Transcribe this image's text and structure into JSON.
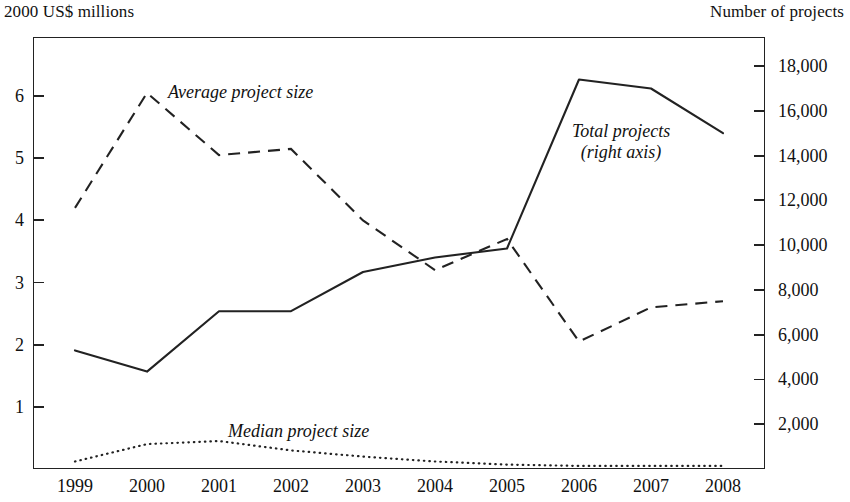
{
  "axis_titles": {
    "left": "2000 US$ millions",
    "right": "Number of projects"
  },
  "annotations": {
    "average": "Average project size",
    "total_line1": "Total projects",
    "total_line2": "(right axis)",
    "median": "Median project size"
  },
  "colors": {
    "ink": "#1a1a1a",
    "axis": "#222222",
    "line": "#222222"
  },
  "chart_data": {
    "type": "line",
    "title": "",
    "subtitle": "",
    "xlabel": "",
    "ylabel": "2000 US$ millions",
    "y2label": "Number of projects",
    "grid": false,
    "legend": "annotations on plot",
    "categories": [
      "1999",
      "2000",
      "2001",
      "2002",
      "2003",
      "2004",
      "2005",
      "2006",
      "2007",
      "2008"
    ],
    "x": [
      1999,
      2000,
      2001,
      2002,
      2003,
      2004,
      2005,
      2006,
      2007,
      2008
    ],
    "ylim": [
      0,
      6.95
    ],
    "yticks": [
      1,
      2,
      3,
      4,
      5,
      6
    ],
    "ytick_labels": [
      "1",
      "2",
      "3",
      "4",
      "5",
      "6"
    ],
    "y2lim": [
      0,
      19300
    ],
    "y2ticks": [
      2000,
      4000,
      6000,
      8000,
      10000,
      12000,
      14000,
      16000,
      18000
    ],
    "y2tick_labels": [
      "2,000",
      "4,000",
      "6,000",
      "8,000",
      "10,000",
      "12,000",
      "14,000",
      "16,000",
      "18,000"
    ],
    "series": [
      {
        "name": "Average project size",
        "axis": "left",
        "style": "dashed",
        "units": "2000 US$ millions",
        "values": [
          4.2,
          6.05,
          5.05,
          5.15,
          4.0,
          3.2,
          3.7,
          2.05,
          2.6,
          2.7
        ]
      },
      {
        "name": "Median project size",
        "axis": "left",
        "style": "dotted",
        "units": "2000 US$ millions",
        "values": [
          0.12,
          0.4,
          0.45,
          0.3,
          0.2,
          0.12,
          0.07,
          0.05,
          0.05,
          0.05
        ]
      },
      {
        "name": "Total projects (right axis)",
        "axis": "right",
        "style": "solid",
        "units": "Number of projects",
        "values": [
          5300,
          4350,
          7050,
          7050,
          8800,
          9450,
          9850,
          17400,
          17000,
          15000
        ]
      }
    ]
  }
}
